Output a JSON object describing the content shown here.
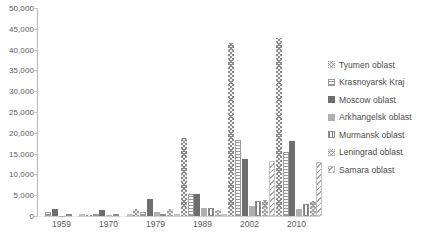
{
  "chart_data": {
    "type": "bar",
    "title": "",
    "xlabel": "",
    "ylabel": "",
    "categories": [
      "1959",
      "1970",
      "1979",
      "1989",
      "2002",
      "2010"
    ],
    "ylim": [
      0,
      50000
    ],
    "ytick_values": [
      0,
      5000,
      10000,
      15000,
      20000,
      25000,
      30000,
      35000,
      40000,
      45000,
      50000
    ],
    "ytick_labels": [
      "0",
      "5,000",
      "10,000",
      "15,000",
      "20,000",
      "25,000",
      "30,000",
      "35,000",
      "40,000",
      "45,000",
      "50,000"
    ],
    "grid": false,
    "legend_position": "right",
    "series": [
      {
        "name": "Tyumen oblast",
        "key": "s0",
        "values": [
          120,
          180,
          1700,
          18800,
          41600,
          42800
        ]
      },
      {
        "name": "Krasnoyarsk Kraj",
        "key": "s1",
        "values": [
          900,
          350,
          900,
          5400,
          18200,
          15500
        ]
      },
      {
        "name": "Moscow oblast",
        "key": "s2",
        "values": [
          1600,
          1400,
          4000,
          5300,
          13800,
          18100
        ]
      },
      {
        "name": "Arkhangelsk oblast",
        "key": "s3",
        "values": [
          120,
          300,
          850,
          2000,
          2300,
          1700
        ]
      },
      {
        "name": "Murmansk oblast",
        "key": "s4",
        "values": [
          60,
          120,
          250,
          1950,
          3600,
          2900
        ]
      },
      {
        "name": "Leningrad oblast",
        "key": "s5",
        "values": [
          80,
          100,
          1650,
          1450,
          3900,
          3500
        ]
      },
      {
        "name": "Samara oblast",
        "key": "s6",
        "values": [
          0,
          0,
          0,
          0,
          13200,
          13000
        ]
      }
    ]
  },
  "top_strip": {
    "text": ""
  }
}
